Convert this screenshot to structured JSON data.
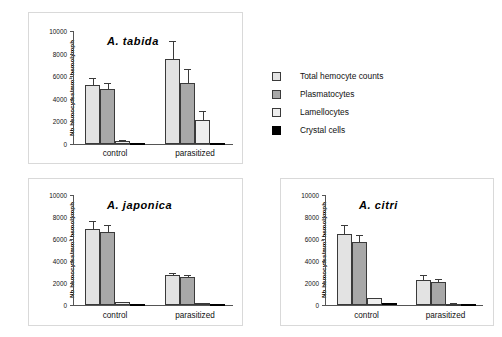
{
  "figure": {
    "ylabel": "Nb hemocytes/mm³ hemolymph",
    "yticks": [
      "0",
      "2000",
      "4000",
      "6000",
      "8000",
      "10000"
    ],
    "categories": [
      "control",
      "parasitized"
    ]
  },
  "legend": {
    "items": [
      {
        "label": "Total hemocyte counts",
        "color": "#e3e3e3"
      },
      {
        "label": "Plasmatocytes",
        "color": "#a8a8a8"
      },
      {
        "label": "Lamellocytes",
        "color": "#efefef"
      },
      {
        "label": "Crystal cells",
        "color": "#000000"
      }
    ]
  },
  "panels": [
    {
      "id": "tabida",
      "title": "A. tabida"
    },
    {
      "id": "japonica",
      "title": "A. japonica"
    },
    {
      "id": "citri",
      "title": "A. citri"
    }
  ],
  "chart_data": [
    {
      "type": "bar",
      "title": "A. tabida",
      "xlabel": "",
      "ylabel": "Nb hemocytes/mm³ hemolymph",
      "ylim": [
        0,
        10000
      ],
      "yticks": [
        0,
        2000,
        4000,
        6000,
        8000,
        10000
      ],
      "grid": false,
      "legend_position": "outside-right",
      "categories": [
        "control",
        "parasitized"
      ],
      "series": [
        {
          "name": "Total hemocyte counts",
          "color": "#e3e3e3",
          "values": [
            5200,
            7550
          ],
          "errors": [
            600,
            1600
          ]
        },
        {
          "name": "Plasmatocytes",
          "color": "#a8a8a8",
          "values": [
            4900,
            5400
          ],
          "errors": [
            500,
            1200
          ]
        },
        {
          "name": "Lamellocytes",
          "color": "#efefef",
          "values": [
            250,
            2150
          ],
          "errors": [
            70,
            750
          ]
        },
        {
          "name": "Crystal cells",
          "color": "#000000",
          "values": [
            50,
            100
          ],
          "errors": [
            0,
            0
          ]
        }
      ]
    },
    {
      "type": "bar",
      "title": "A. japonica",
      "xlabel": "",
      "ylabel": "Nb hemocytes/mm³ hemolymph",
      "ylim": [
        0,
        10000
      ],
      "yticks": [
        0,
        2000,
        4000,
        6000,
        8000,
        10000
      ],
      "grid": false,
      "legend_position": "outside-right",
      "categories": [
        "control",
        "parasitized"
      ],
      "series": [
        {
          "name": "Total hemocyte counts",
          "color": "#e3e3e3",
          "values": [
            6900,
            2700
          ],
          "errors": [
            700,
            200
          ]
        },
        {
          "name": "Plasmatocytes",
          "color": "#a8a8a8",
          "values": [
            6600,
            2550
          ],
          "errors": [
            650,
            200
          ]
        },
        {
          "name": "Lamellocytes",
          "color": "#efefef",
          "values": [
            250,
            150
          ],
          "errors": [
            60,
            40
          ]
        },
        {
          "name": "Crystal cells",
          "color": "#000000",
          "values": [
            50,
            30
          ],
          "errors": [
            0,
            0
          ]
        }
      ]
    },
    {
      "type": "bar",
      "title": "A. citri",
      "xlabel": "",
      "ylabel": "Nb hemocytes/mm³ hemolymph",
      "ylim": [
        0,
        10000
      ],
      "yticks": [
        0,
        2000,
        4000,
        6000,
        8000,
        10000
      ],
      "grid": false,
      "legend_position": "outside-right",
      "categories": [
        "control",
        "parasitized"
      ],
      "series": [
        {
          "name": "Total hemocyte counts",
          "color": "#e3e3e3",
          "values": [
            6500,
            2300
          ],
          "errors": [
            750,
            400
          ]
        },
        {
          "name": "Plasmatocytes",
          "color": "#a8a8a8",
          "values": [
            5700,
            2050
          ],
          "errors": [
            700,
            300
          ]
        },
        {
          "name": "Lamellocytes",
          "color": "#efefef",
          "values": [
            600,
            100
          ],
          "errors": [
            60,
            30
          ]
        },
        {
          "name": "Crystal cells",
          "color": "#000000",
          "values": [
            200,
            100
          ],
          "errors": [
            0,
            0
          ]
        }
      ]
    }
  ]
}
